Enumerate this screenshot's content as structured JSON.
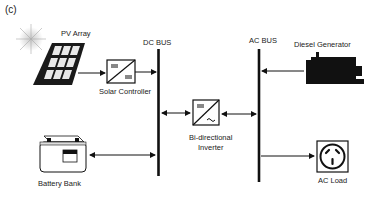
{
  "figure": {
    "panel_label": "(c)",
    "buses": {
      "dc": "DC BUS",
      "ac": "AC BUS"
    },
    "components": {
      "pv_array": "PV Array",
      "solar_controller": "Solar Controller",
      "battery_bank": "Battery Bank",
      "inverter_line1": "Bi-directional",
      "inverter_line2": "Inverter",
      "diesel_generator": "Diesel  Generator",
      "ac_load": "AC Load"
    },
    "connections": [
      {
        "from": "PV Array",
        "to": "Solar Controller",
        "direction": "one-way"
      },
      {
        "from": "Solar Controller",
        "to": "DC BUS",
        "direction": "one-way"
      },
      {
        "from": "Battery Bank",
        "to": "DC BUS",
        "direction": "two-way"
      },
      {
        "from": "DC BUS",
        "to": "Bi-directional Inverter",
        "direction": "two-way"
      },
      {
        "from": "Bi-directional Inverter",
        "to": "AC BUS",
        "direction": "two-way"
      },
      {
        "from": "Diesel Generator",
        "to": "AC BUS",
        "direction": "one-way"
      },
      {
        "from": "AC BUS",
        "to": "AC Load",
        "direction": "one-way"
      }
    ],
    "colors": {
      "ink": "#111111",
      "text": "#222222",
      "background": "#ffffff"
    }
  }
}
